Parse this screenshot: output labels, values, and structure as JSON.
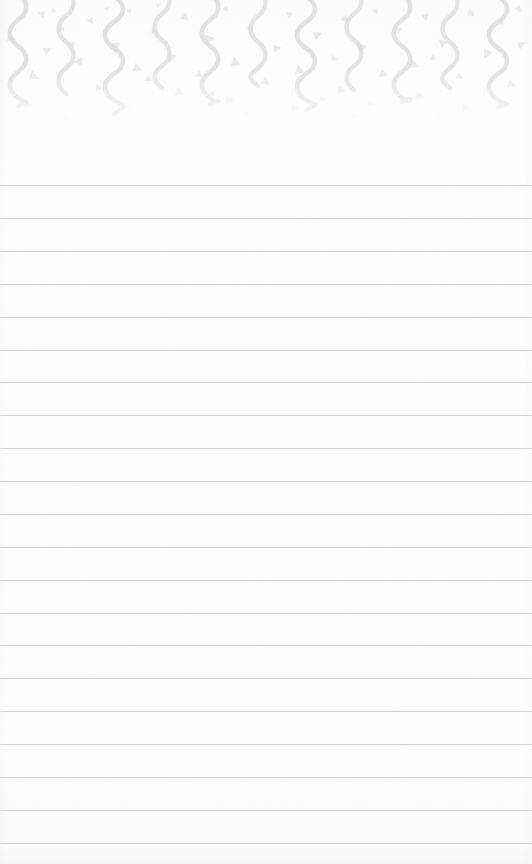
{
  "document": {
    "kind": "lined-notepad-page",
    "title": "Blank Lined Notepad Page",
    "orientation": "portrait",
    "width_px": 532,
    "height_px": 864,
    "body_text": "",
    "placeholder": ""
  },
  "paper": {
    "background_color": "#ffffff",
    "tint_color": "#fdfdfd",
    "bottom_tint_color": "#fcfbfa",
    "texture_color": "#f4f4f5"
  },
  "header_decoration": {
    "name": "confetti-streamer-border",
    "band_height_px": 130,
    "streamer_color": "#dcdcdc",
    "confetti_color": "#d9d9d9",
    "streamer_count": 11,
    "streamer_spacing_px": 48,
    "streamer_stroke_px": 4.5,
    "streamer_wave_amplitude_px": 11,
    "confetti_shape": "triangle",
    "confetti_count": 62,
    "fade_start_px": 70,
    "fade_end_px": 125,
    "streamers": [
      {
        "x": 18,
        "top": -6,
        "length": 112,
        "amplitude": 11,
        "opacity": 0.85
      },
      {
        "x": 66,
        "top": -10,
        "length": 104,
        "amplitude": 10,
        "opacity": 0.8
      },
      {
        "x": 114,
        "top": -4,
        "length": 118,
        "amplitude": 12,
        "opacity": 0.85
      },
      {
        "x": 162,
        "top": -12,
        "length": 100,
        "amplitude": 10,
        "opacity": 0.75
      },
      {
        "x": 210,
        "top": -6,
        "length": 110,
        "amplitude": 11,
        "opacity": 0.82
      },
      {
        "x": 258,
        "top": -10,
        "length": 96,
        "amplitude": 10,
        "opacity": 0.78
      },
      {
        "x": 306,
        "top": -4,
        "length": 114,
        "amplitude": 12,
        "opacity": 0.85
      },
      {
        "x": 354,
        "top": -12,
        "length": 102,
        "amplitude": 10,
        "opacity": 0.76
      },
      {
        "x": 402,
        "top": -6,
        "length": 108,
        "amplitude": 11,
        "opacity": 0.82
      },
      {
        "x": 450,
        "top": -10,
        "length": 98,
        "amplitude": 10,
        "opacity": 0.78
      },
      {
        "x": 498,
        "top": -4,
        "length": 112,
        "amplitude": 12,
        "opacity": 0.84
      }
    ],
    "confetti": [
      {
        "x": 8,
        "y": 34,
        "size": 9,
        "rot": 18,
        "opacity": 0.55
      },
      {
        "x": 38,
        "y": 10,
        "size": 7,
        "rot": 200,
        "opacity": 0.5
      },
      {
        "x": 44,
        "y": 46,
        "size": 8,
        "rot": 340,
        "opacity": 0.55
      },
      {
        "x": 30,
        "y": 72,
        "size": 10,
        "rot": 25,
        "opacity": 0.5
      },
      {
        "x": 24,
        "y": 100,
        "size": 9,
        "rot": 10,
        "opacity": 0.42
      },
      {
        "x": 58,
        "y": 26,
        "size": 6,
        "rot": 150,
        "opacity": 0.45
      },
      {
        "x": 76,
        "y": 56,
        "size": 9,
        "rot": 300,
        "opacity": 0.55
      },
      {
        "x": 88,
        "y": 18,
        "size": 7,
        "rot": 60,
        "opacity": 0.5
      },
      {
        "x": 96,
        "y": 84,
        "size": 8,
        "rot": 12,
        "opacity": 0.45
      },
      {
        "x": 112,
        "y": 40,
        "size": 10,
        "rot": 330,
        "opacity": 0.55
      },
      {
        "x": 126,
        "y": 8,
        "size": 6,
        "rot": 210,
        "opacity": 0.45
      },
      {
        "x": 134,
        "y": 64,
        "size": 9,
        "rot": 20,
        "opacity": 0.5
      },
      {
        "x": 122,
        "y": 102,
        "size": 9,
        "rot": 8,
        "opacity": 0.4
      },
      {
        "x": 150,
        "y": 28,
        "size": 7,
        "rot": 120,
        "opacity": 0.48
      },
      {
        "x": 168,
        "y": 52,
        "size": 10,
        "rot": 345,
        "opacity": 0.55
      },
      {
        "x": 182,
        "y": 14,
        "size": 8,
        "rot": 40,
        "opacity": 0.5
      },
      {
        "x": 176,
        "y": 88,
        "size": 9,
        "rot": 15,
        "opacity": 0.45
      },
      {
        "x": 196,
        "y": 70,
        "size": 7,
        "rot": 280,
        "opacity": 0.48
      },
      {
        "x": 206,
        "y": 34,
        "size": 9,
        "rot": 350,
        "opacity": 0.55
      },
      {
        "x": 222,
        "y": 6,
        "size": 6,
        "rot": 170,
        "opacity": 0.42
      },
      {
        "x": 232,
        "y": 58,
        "size": 10,
        "rot": 22,
        "opacity": 0.52
      },
      {
        "x": 226,
        "y": 96,
        "size": 9,
        "rot": 5,
        "opacity": 0.4
      },
      {
        "x": 248,
        "y": 24,
        "size": 7,
        "rot": 310,
        "opacity": 0.48
      },
      {
        "x": 262,
        "y": 78,
        "size": 9,
        "rot": 30,
        "opacity": 0.48
      },
      {
        "x": 274,
        "y": 44,
        "size": 8,
        "rot": 355,
        "opacity": 0.55
      },
      {
        "x": 286,
        "y": 12,
        "size": 7,
        "rot": 100,
        "opacity": 0.45
      },
      {
        "x": 296,
        "y": 66,
        "size": 10,
        "rot": 18,
        "opacity": 0.5
      },
      {
        "x": 292,
        "y": 104,
        "size": 8,
        "rot": 12,
        "opacity": 0.38
      },
      {
        "x": 314,
        "y": 30,
        "size": 9,
        "rot": 340,
        "opacity": 0.55
      },
      {
        "x": 330,
        "y": 54,
        "size": 7,
        "rot": 250,
        "opacity": 0.48
      },
      {
        "x": 342,
        "y": 16,
        "size": 8,
        "rot": 45,
        "opacity": 0.5
      },
      {
        "x": 338,
        "y": 86,
        "size": 9,
        "rot": 10,
        "opacity": 0.44
      },
      {
        "x": 358,
        "y": 42,
        "size": 10,
        "rot": 350,
        "opacity": 0.55
      },
      {
        "x": 372,
        "y": 8,
        "size": 6,
        "rot": 190,
        "opacity": 0.42
      },
      {
        "x": 380,
        "y": 70,
        "size": 9,
        "rot": 25,
        "opacity": 0.48
      },
      {
        "x": 368,
        "y": 100,
        "size": 8,
        "rot": 6,
        "opacity": 0.38
      },
      {
        "x": 396,
        "y": 26,
        "size": 7,
        "rot": 320,
        "opacity": 0.48
      },
      {
        "x": 410,
        "y": 60,
        "size": 10,
        "rot": 20,
        "opacity": 0.5
      },
      {
        "x": 422,
        "y": 14,
        "size": 8,
        "rot": 80,
        "opacity": 0.5
      },
      {
        "x": 416,
        "y": 92,
        "size": 9,
        "rot": 14,
        "opacity": 0.42
      },
      {
        "x": 440,
        "y": 38,
        "size": 9,
        "rot": 345,
        "opacity": 0.55
      },
      {
        "x": 456,
        "y": 72,
        "size": 7,
        "rot": 270,
        "opacity": 0.46
      },
      {
        "x": 468,
        "y": 10,
        "size": 8,
        "rot": 35,
        "opacity": 0.5
      },
      {
        "x": 462,
        "y": 104,
        "size": 8,
        "rot": 8,
        "opacity": 0.36
      },
      {
        "x": 484,
        "y": 48,
        "size": 10,
        "rot": 355,
        "opacity": 0.52
      },
      {
        "x": 498,
        "y": 20,
        "size": 6,
        "rot": 160,
        "opacity": 0.44
      },
      {
        "x": 508,
        "y": 80,
        "size": 9,
        "rot": 22,
        "opacity": 0.45
      },
      {
        "x": 518,
        "y": 40,
        "size": 8,
        "rot": 330,
        "opacity": 0.5
      },
      {
        "x": 516,
        "y": 6,
        "size": 7,
        "rot": 50,
        "opacity": 0.45
      },
      {
        "x": 52,
        "y": 8,
        "size": 5,
        "rot": 0,
        "opacity": 0.4
      },
      {
        "x": 104,
        "y": 6,
        "size": 5,
        "rot": 180,
        "opacity": 0.38
      },
      {
        "x": 156,
        "y": 4,
        "size": 5,
        "rot": 90,
        "opacity": 0.38
      },
      {
        "x": 244,
        "y": 110,
        "size": 7,
        "rot": 10,
        "opacity": 0.3
      },
      {
        "x": 352,
        "y": 112,
        "size": 7,
        "rot": 14,
        "opacity": 0.28
      },
      {
        "x": 64,
        "y": 114,
        "size": 7,
        "rot": 16,
        "opacity": 0.28
      },
      {
        "x": 438,
        "y": 116,
        "size": 6,
        "rot": 12,
        "opacity": 0.26
      },
      {
        "x": 192,
        "y": 118,
        "size": 6,
        "rot": 8,
        "opacity": 0.24
      },
      {
        "x": 70,
        "y": 40,
        "size": 6,
        "rot": 290,
        "opacity": 0.42
      },
      {
        "x": 210,
        "y": 90,
        "size": 6,
        "rot": 300,
        "opacity": 0.4
      },
      {
        "x": 320,
        "y": 96,
        "size": 7,
        "rot": 18,
        "opacity": 0.4
      },
      {
        "x": 430,
        "y": 54,
        "size": 6,
        "rot": 260,
        "opacity": 0.44
      },
      {
        "x": 146,
        "y": 76,
        "size": 7,
        "rot": 28,
        "opacity": 0.44
      }
    ]
  },
  "ruling": {
    "name": "ruled-lines",
    "line_color": "#c8ccd2",
    "line_thickness_px": 1,
    "line_spacing_px": 32.9,
    "first_line_y_px": 185,
    "last_line_y_px": 843,
    "line_count": 21,
    "full_bleed": true,
    "margin_line": false,
    "lines_y": [
      185,
      218,
      251,
      284,
      317,
      350,
      382,
      415,
      448,
      481,
      514,
      547,
      580,
      613,
      645,
      678,
      711,
      744,
      777,
      810,
      843
    ]
  }
}
